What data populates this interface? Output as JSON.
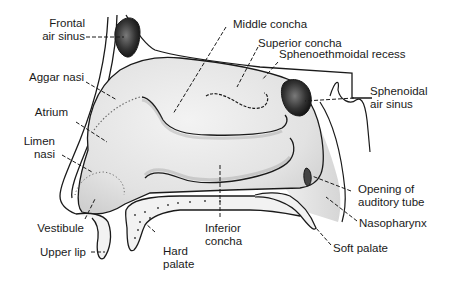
{
  "figure": {
    "type": "anatomical-diagram",
    "colors": {
      "outline": "#1a1a1a",
      "cavity_fill": "#e4e4e4",
      "sinus_fill": "#2a2a2a",
      "background": "#ffffff"
    }
  },
  "labels": {
    "frontal_air_sinus": "Frontal\nair sinus",
    "aggar_nasi": "Aggar nasi",
    "atrium": "Atrium",
    "limen_nasi": "Limen\nnasi",
    "vestibule": "Vestibule",
    "upper_lip": "Upper lip",
    "hard_palate": "Hard\npalate",
    "inferior_concha": "Inferior\nconcha",
    "middle_concha": "Middle concha",
    "superior_concha": "Superior concha",
    "sphenoethmoidal_recess": "Sphenoethmoidal recess",
    "sphenoidal_air_sinus": "Sphenoidal\nair sinus",
    "opening_of_auditory_tube": "Opening of\nauditory tube",
    "nasopharynx": "Nasopharynx",
    "soft_palate": "Soft palate"
  }
}
